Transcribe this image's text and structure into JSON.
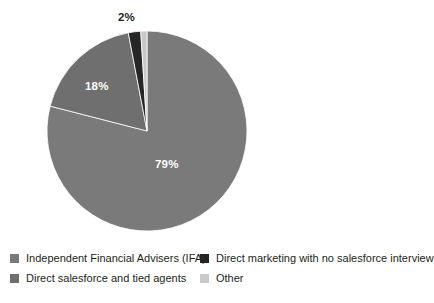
{
  "chart_data": {
    "type": "pie",
    "title": "",
    "subtitle": "",
    "xlabel": "",
    "ylabel": "",
    "grid": false,
    "legend_position": "bottom",
    "legend_columns": 2,
    "categories": [
      "Independent Financial Advisers (IFA)",
      "Direct salesforce and tied agents",
      "Direct marketing with no salesforce interview",
      "Other"
    ],
    "values": [
      79,
      18,
      2,
      1
    ],
    "value_labels": [
      "79%",
      "18%",
      "2%",
      ""
    ],
    "label_placement": [
      "inside",
      "inside",
      "outside",
      "none"
    ],
    "colors": [
      "#7a7a7a",
      "#6f6f6f",
      "#262626",
      "#c9c9c9"
    ],
    "start_angle_deg": -90,
    "direction": "clockwise",
    "units": "percent"
  },
  "labels": {
    "slice_0": "79%",
    "slice_1": "18%",
    "slice_2": "2%"
  },
  "legend": {
    "items": [
      {
        "label": "Independent Financial Advisers (IFA)",
        "color": "#7a7a7a",
        "value": "79%"
      },
      {
        "label": "Direct marketing with no salesforce interview",
        "color": "#262626",
        "value": "2%"
      },
      {
        "label": "Direct salesforce and tied agents",
        "color": "#6f6f6f",
        "value": "18%"
      },
      {
        "label": "Other",
        "color": "#c9c9c9",
        "value": "1%"
      }
    ]
  },
  "geometry": {
    "center_x": 147,
    "center_y": 131,
    "radius": 100
  }
}
